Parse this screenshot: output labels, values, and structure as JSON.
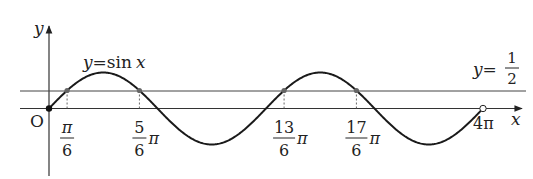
{
  "diagram": {
    "type": "function-graph",
    "function_label": "y=sin x",
    "function_label_parts": {
      "y": "y",
      "eq": "=",
      "fn": "sin",
      "var": "x"
    },
    "line_label_parts": {
      "y": "y",
      "eq": "=",
      "num": "1",
      "den": "2"
    },
    "axis_labels": {
      "x": "x",
      "y": "y",
      "origin": "O"
    },
    "domain_end_label": "4π",
    "intersections": [
      {
        "num": "π",
        "den": "6",
        "suffix": ""
      },
      {
        "num": "5",
        "den": "6",
        "suffix": "π"
      },
      {
        "num": "13",
        "den": "6",
        "suffix": "π"
      },
      {
        "num": "17",
        "den": "6",
        "suffix": "π"
      }
    ],
    "colors": {
      "curve": "#1a1a1a",
      "axis": "#333333",
      "line": "#444444",
      "point": "#666666"
    }
  },
  "chart_data": {
    "type": "line",
    "title": "",
    "series": [
      {
        "name": "y=sin x",
        "x_range": [
          0,
          "4π"
        ]
      },
      {
        "name": "y=1/2",
        "constant": 0.5
      }
    ],
    "intersection_x": [
      "π/6",
      "5π/6",
      "13π/6",
      "17π/6"
    ],
    "xlabel": "x",
    "ylabel": "y",
    "grid": false
  }
}
